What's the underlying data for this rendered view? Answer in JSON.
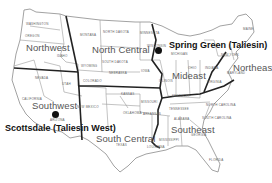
{
  "map": {
    "title": "",
    "regions": [
      {
        "name": "Northwest",
        "x": 26,
        "y": 42
      },
      {
        "name": "North Central",
        "x": 92,
        "y": 45
      },
      {
        "name": "Mideast",
        "x": 172,
        "y": 70
      },
      {
        "name": "Northeast",
        "x": 233,
        "y": 62
      },
      {
        "name": "Southwest",
        "x": 32,
        "y": 101
      },
      {
        "name": "South Central",
        "x": 96,
        "y": 133
      },
      {
        "name": "Southeast",
        "x": 171,
        "y": 124
      }
    ],
    "sites": [
      {
        "name": "Spring Green (Taliesin)",
        "x": 169,
        "y": 40,
        "marker_x": 158,
        "marker_y": 48
      },
      {
        "name": "Scottsdale (Taliesin West)",
        "x": 5,
        "y": 124,
        "marker_x": 52,
        "marker_y": 111
      }
    ],
    "states": [
      {
        "name": "WASHINGTON",
        "x": 26,
        "y": 22
      },
      {
        "name": "OREGON",
        "x": 25,
        "y": 34
      },
      {
        "name": "IDAHO",
        "x": 57,
        "y": 54
      },
      {
        "name": "MONTANA",
        "x": 80,
        "y": 33
      },
      {
        "name": "NORTH DAKOTA",
        "x": 103,
        "y": 30
      },
      {
        "name": "SOUTH DAKOTA",
        "x": 102,
        "y": 60
      },
      {
        "name": "WYOMING",
        "x": 81,
        "y": 64
      },
      {
        "name": "NEBRASKA",
        "x": 109,
        "y": 71
      },
      {
        "name": "COLORADO",
        "x": 83,
        "y": 79
      },
      {
        "name": "NEVADA",
        "x": 35,
        "y": 76
      },
      {
        "name": "UTAH",
        "x": 62,
        "y": 82
      },
      {
        "name": "CALIFORNIA",
        "x": 22,
        "y": 97
      },
      {
        "name": "ARIZONA",
        "x": 50,
        "y": 118
      },
      {
        "name": "NEW MEXICO",
        "x": 77,
        "y": 105
      },
      {
        "name": "KANSAS",
        "x": 121,
        "y": 92
      },
      {
        "name": "OKLAHOMA",
        "x": 123,
        "y": 111
      },
      {
        "name": "TEXAS",
        "x": 116,
        "y": 143
      },
      {
        "name": "MINNESOTA",
        "x": 140,
        "y": 31
      },
      {
        "name": "IOWA",
        "x": 141,
        "y": 69
      },
      {
        "name": "WISCONSIN",
        "x": 147,
        "y": 44
      },
      {
        "name": "MICHIGAN",
        "x": 171,
        "y": 52
      },
      {
        "name": "ILLINOIS",
        "x": 159,
        "y": 79
      },
      {
        "name": "MISSOURI",
        "x": 141,
        "y": 100
      },
      {
        "name": "ARKANSAS",
        "x": 143,
        "y": 112
      },
      {
        "name": "LOUISIANA",
        "x": 147,
        "y": 145
      },
      {
        "name": "MISSISSIPPI",
        "x": 159,
        "y": 138
      },
      {
        "name": "KENTUCKY",
        "x": 172,
        "y": 94
      },
      {
        "name": "TENNESSEE",
        "x": 169,
        "y": 107
      },
      {
        "name": "ALABAMA",
        "x": 174,
        "y": 117
      },
      {
        "name": "GEORGIA",
        "x": 191,
        "y": 133
      },
      {
        "name": "FLORIDA",
        "x": 209,
        "y": 158
      },
      {
        "name": "NORTH CAROLINA",
        "x": 206,
        "y": 103
      },
      {
        "name": "SOUTH CAROLINA",
        "x": 202,
        "y": 116
      },
      {
        "name": "NEW YORK",
        "x": 221,
        "y": 53
      },
      {
        "name": "MAINE",
        "x": 243,
        "y": 27
      },
      {
        "name": "INDIANA",
        "x": 205,
        "y": 66
      },
      {
        "name": "MARYLAND",
        "x": 227,
        "y": 71
      },
      {
        "name": "VIRGINIA",
        "x": 207,
        "y": 80
      },
      {
        "name": "OHIO",
        "x": 188,
        "y": 66
      }
    ]
  }
}
